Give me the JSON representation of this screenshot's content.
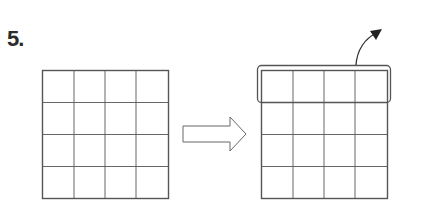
{
  "step": {
    "number_label": "5."
  },
  "diagram": {
    "before_grid": {
      "rows": 4,
      "cols": 4
    },
    "transition": {
      "icon": "right-arrow-outline"
    },
    "after_grid": {
      "rows": 4,
      "cols": 4,
      "highlighted_row": 1,
      "highlight_action": "curved-arrow-up-right"
    }
  }
}
